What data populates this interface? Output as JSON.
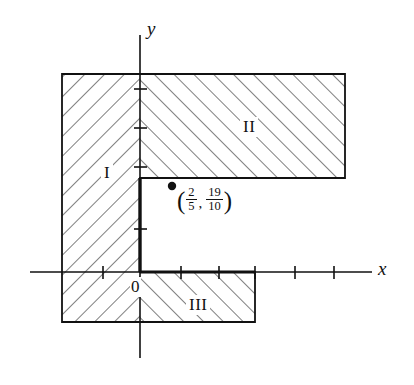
{
  "figure": {
    "kind": "shaded-region-coordinate-plane",
    "axes": {
      "x_label": "x",
      "y_label": "y",
      "origin_label": "0",
      "x_ticks": [
        -1,
        1,
        2,
        3,
        4
      ],
      "y_ticks": [
        1,
        2,
        3,
        4
      ]
    },
    "regions": [
      {
        "id": "I",
        "label": "I",
        "hatch": "negative-slope"
      },
      {
        "id": "II",
        "label": "II",
        "hatch": "positive-slope"
      },
      {
        "id": "III",
        "label": "III",
        "hatch": "positive-slope"
      }
    ],
    "marked_point": {
      "open_paren": "(",
      "close_paren": ")",
      "comma": ",",
      "x_numerator": "2",
      "x_denominator": "5",
      "y_numerator": "19",
      "y_denominator": "10"
    },
    "colors": {
      "ink": "#111111",
      "hatch": "#555555",
      "background": "#ffffff"
    }
  }
}
